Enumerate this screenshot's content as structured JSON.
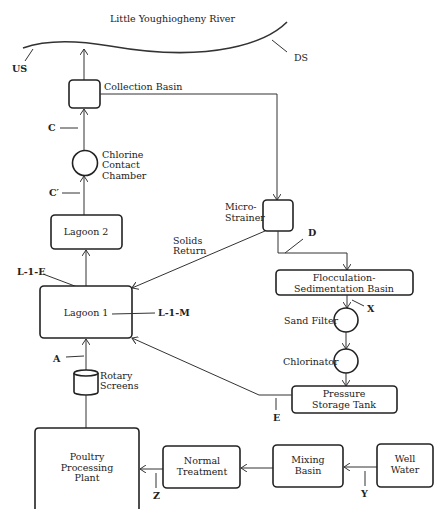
{
  "river": {
    "label": "Little Youghiogheny River",
    "upstream_label": "US",
    "downstream_label": "DS"
  },
  "nodes": {
    "collection_basin": "Collection Basin",
    "chlorine_chamber": [
      "Chlorine",
      "Contact",
      "Chamber"
    ],
    "lagoon2": "Lagoon 2",
    "lagoon1": "Lagoon 1",
    "micro_strainer": [
      "Micro-",
      "Strainer"
    ],
    "solids_return": [
      "Solids",
      "Return"
    ],
    "flocculation": [
      "Flocculation-",
      "Sedimentation  Basin"
    ],
    "sand_filter": "Sand Filter",
    "chlorinator": "Chlorinator",
    "pressure_tank": [
      "Pressure",
      "Storage Tank"
    ],
    "rotary_screens": [
      "Rotary",
      "Screens"
    ],
    "poultry_plant": [
      "Poultry",
      "Processing",
      "Plant"
    ],
    "normal_treatment": [
      "Normal",
      "Treatment"
    ],
    "mixing_basin": [
      "Mixing",
      "Basin"
    ],
    "well_water": [
      "Well",
      "Water"
    ]
  },
  "sample_points": {
    "C": "C",
    "C_prime": "C′",
    "D": "D",
    "L1E": "L-1-E",
    "L1M": "L-1-M",
    "A": "A",
    "X": "X",
    "E": "E",
    "Z": "Z",
    "Y": "Y"
  }
}
